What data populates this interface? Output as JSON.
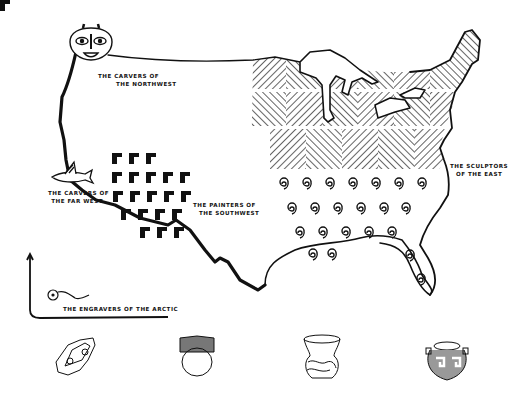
{
  "colors": {
    "ink": "#111111",
    "paper": "#ffffff"
  },
  "regions": [
    {
      "id": "northwest",
      "line1": "THE CARVERS OF",
      "line2": "THE NORTHWEST",
      "motif": "carved-mask-icon"
    },
    {
      "id": "far_west",
      "line1": "THE CARVERS OF",
      "line2": "THE FAR WEST",
      "motif": "carved-fish-icon"
    },
    {
      "id": "southwest",
      "line1": "THE PAINTERS OF",
      "line2": "THE SOUTHWEST",
      "motif": "stepped-block-pattern"
    },
    {
      "id": "east",
      "line1": "THE SCULPTORS",
      "line2": "OF THE EAST",
      "motif": "diagonal-hatch-and-spiral-pattern"
    },
    {
      "id": "arctic",
      "line1": "THE ENGRAVERS OF THE ARCTIC",
      "motif": "engraved-harpoon-icon"
    }
  ],
  "artifacts": [
    {
      "id": "engraved-stone",
      "name": "engraved stone amulet"
    },
    {
      "id": "hatched-bowl",
      "name": "round pot with hatched rim"
    },
    {
      "id": "swirl-vase",
      "name": "flared vase with swirl design"
    },
    {
      "id": "fret-jar",
      "name": "jar with fret pattern"
    }
  ]
}
